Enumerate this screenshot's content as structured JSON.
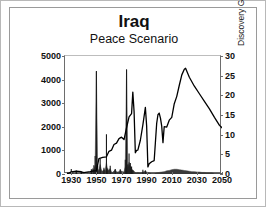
{
  "figure": {
    "title": "Iraq",
    "subtitle": "Peace Scenario"
  },
  "chart_data": {
    "type": "line",
    "title": "Iraq",
    "subtitle": "Peace Scenario",
    "xlabel": "",
    "xlim": [
      1925,
      2050
    ],
    "xticks": [
      1930,
      1950,
      1970,
      1990,
      2010,
      2030,
      2050
    ],
    "grid": false,
    "legend": "none",
    "axes": [
      {
        "side": "left",
        "ylabel": "Production kb/d",
        "ylim": [
          0,
          5000
        ],
        "yticks": [
          0,
          1000,
          2000,
          3000,
          4000,
          5000
        ]
      },
      {
        "side": "right",
        "ylabel": "Discovery Gb (shaded)",
        "ylim": [
          0,
          30
        ],
        "yticks": [
          0,
          5,
          10,
          15,
          20,
          25,
          30
        ]
      }
    ],
    "series": [
      {
        "name": "Production kb/d",
        "axis": "left",
        "type": "line",
        "color": "#000000",
        "x": [
          1927,
          1930,
          1934,
          1938,
          1940,
          1945,
          1948,
          1950,
          1952,
          1955,
          1958,
          1960,
          1962,
          1964,
          1966,
          1968,
          1970,
          1972,
          1974,
          1976,
          1978,
          1979,
          1980,
          1981,
          1982,
          1983,
          1985,
          1987,
          1989,
          1990,
          1991,
          1992,
          1994,
          1996,
          1998,
          1999,
          2000,
          2001,
          2002,
          2003,
          2004,
          2006,
          2008,
          2010,
          2012,
          2014,
          2016,
          2018,
          2020,
          2021,
          2024,
          2028,
          2032,
          2036,
          2040,
          2044,
          2048,
          2050
        ],
        "y": [
          10,
          90,
          120,
          95,
          60,
          100,
          130,
          140,
          650,
          700,
          730,
          960,
          1010,
          1250,
          1310,
          1500,
          1560,
          1460,
          1960,
          2420,
          2560,
          3470,
          2650,
          900,
          1000,
          1010,
          1430,
          2080,
          2820,
          2040,
          300,
          430,
          520,
          570,
          2150,
          2510,
          2580,
          2370,
          2030,
          1330,
          2010,
          1990,
          2280,
          2400,
          2980,
          3290,
          3760,
          4200,
          4440,
          4480,
          4100,
          3720,
          3400,
          3080,
          2760,
          2400,
          2060,
          1960
        ]
      },
      {
        "name": "Discovery Gb (shaded)",
        "axis": "right",
        "type": "area",
        "color": "#3a3a3a",
        "x": [
          1927,
          1928,
          1929,
          1930,
          1931,
          1932,
          1933,
          1934,
          1935,
          1936,
          1937,
          1938,
          1939,
          1940,
          1941,
          1942,
          1943,
          1944,
          1945,
          1946,
          1947,
          1948,
          1949,
          1950,
          1951,
          1952,
          1953,
          1954,
          1955,
          1956,
          1957,
          1958,
          1959,
          1960,
          1961,
          1962,
          1963,
          1964,
          1965,
          1966,
          1967,
          1968,
          1969,
          1970,
          1971,
          1972,
          1973,
          1974,
          1975,
          1976,
          1977,
          1978,
          1979,
          1980,
          1981,
          1982,
          1983,
          1984,
          1985,
          1986,
          1987,
          1988,
          1989,
          1990,
          1992,
          1994,
          1996,
          1998,
          2000,
          2002,
          2004,
          2006,
          2008,
          2010,
          2012,
          2014,
          2016,
          2018,
          2020,
          2022,
          2024,
          2026,
          2028,
          2030,
          2032,
          2034,
          2036,
          2038,
          2040,
          2042,
          2044,
          2046,
          2048,
          2050
        ],
        "y": [
          0.1,
          0.2,
          0.1,
          0.6,
          0.3,
          0.2,
          0.1,
          0.4,
          0.2,
          0.1,
          0.1,
          0.3,
          0.2,
          0.1,
          0.1,
          0.1,
          0.2,
          0.1,
          0.2,
          0.6,
          1.4,
          1.1,
          2.2,
          26.0,
          1.3,
          0.9,
          2.4,
          1.0,
          0.7,
          1.2,
          0.9,
          2.9,
          0.8,
          1.1,
          1.4,
          0.5,
          0.4,
          0.8,
          1.1,
          0.6,
          0.5,
          0.6,
          1.0,
          0.7,
          0.6,
          0.5,
          2.0,
          26.5,
          1.6,
          3.0,
          2.0,
          1.4,
          0.9,
          0.7,
          0.4,
          0.3,
          0.4,
          0.3,
          0.3,
          0.4,
          0.5,
          0.6,
          0.8,
          0.5,
          0.3,
          0.2,
          0.2,
          0.3,
          0.4,
          0.5,
          0.6,
          0.8,
          0.9,
          1.1,
          1.2,
          1.2,
          1.1,
          1.0,
          0.9,
          0.8,
          0.7,
          0.6,
          0.6,
          0.5,
          0.5,
          0.4,
          0.4,
          0.3,
          0.3,
          0.3,
          0.2,
          0.2,
          0.2,
          0.1
        ]
      },
      {
        "name": "Discovery spikes (annual, Gb)",
        "axis": "right",
        "type": "impulse",
        "color": "#1a1a1a",
        "x": [
          1927,
          1930,
          1934,
          1938,
          1946,
          1948,
          1949,
          1950,
          1951,
          1953,
          1956,
          1958,
          1959,
          1961,
          1965,
          1969,
          1973,
          1974,
          1975,
          1976,
          1977,
          1978,
          1979,
          1987,
          1989
        ],
        "y": [
          0.4,
          1.3,
          0.9,
          0.6,
          1.2,
          2.2,
          4.6,
          26.2,
          2.1,
          3.9,
          1.6,
          10.1,
          1.4,
          2.1,
          1.3,
          1.2,
          3.6,
          26.6,
          2.4,
          5.2,
          2.8,
          1.9,
          1.0,
          1.1,
          0.9
        ]
      }
    ]
  },
  "left_axis": {
    "label": "Production kb/d",
    "ticks": [
      "5000",
      "4000",
      "3000",
      "2000",
      "1000",
      "0"
    ]
  },
  "right_axis": {
    "label": "Discovery Gb (shaded)",
    "ticks": [
      "30",
      "25",
      "20",
      "15",
      "10",
      "5",
      "0"
    ]
  },
  "x_axis": {
    "ticks": [
      "1930",
      "1950",
      "1970",
      "1990",
      "2010",
      "2030",
      "2050"
    ]
  },
  "colors": {
    "line": "#000000",
    "shaded": "#3a3a3a",
    "frame": "#6d6d6d",
    "border": "#9a9a9a"
  }
}
